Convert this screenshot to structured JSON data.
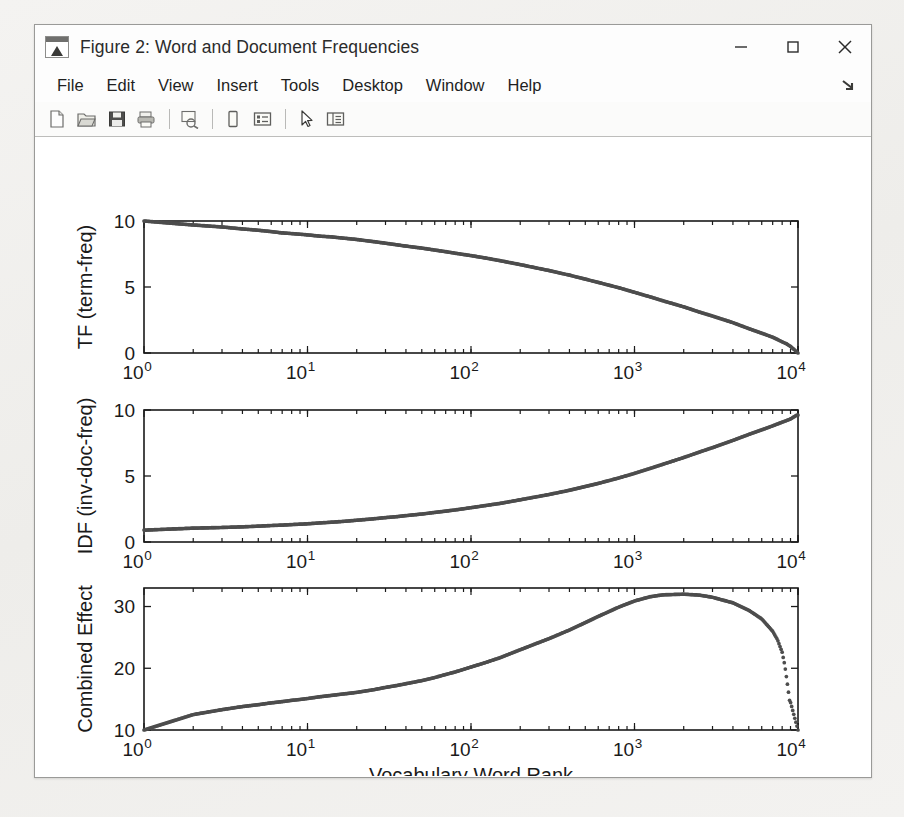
{
  "window": {
    "title": "Figure 2: Word and Document Frequencies",
    "icon": "matlab-figure-icon",
    "controls": {
      "minimize": "minimize-button",
      "maximize": "maximize-button",
      "close": "close-button"
    }
  },
  "menubar": {
    "items": [
      "File",
      "Edit",
      "View",
      "Insert",
      "Tools",
      "Desktop",
      "Window",
      "Help"
    ],
    "dock_icon": "dock-arrow-icon"
  },
  "toolbar": {
    "buttons": [
      {
        "name": "new-figure-icon"
      },
      {
        "name": "open-file-icon"
      },
      {
        "name": "save-figure-icon"
      },
      {
        "name": "print-figure-icon"
      },
      {
        "sep": true
      },
      {
        "name": "print-preview-icon"
      },
      {
        "sep": true
      },
      {
        "name": "insert-colorbar-icon"
      },
      {
        "name": "insert-legend-icon"
      },
      {
        "sep": true
      },
      {
        "name": "edit-plot-arrow-icon"
      },
      {
        "name": "show-plot-tools-icon"
      }
    ]
  },
  "figure": {
    "background": "#ffffff",
    "marker_color": "#4d4d4d",
    "axis_color": "#1a1a1a",
    "shared_xlabel": "Vocabulary Word Rank",
    "x_tick_labels": [
      "10^0",
      "10^1",
      "10^2",
      "10^3",
      "10^4"
    ]
  },
  "chart_data": [
    {
      "type": "scatter",
      "id": "tf-subplot",
      "title": "",
      "xlabel": "",
      "ylabel": "TF (term-freq)",
      "xscale": "log",
      "xlim": [
        1,
        10000
      ],
      "ylim": [
        0,
        10
      ],
      "yticks": [
        0,
        5,
        10
      ],
      "ytick_labels": [
        "0",
        "5",
        "10"
      ],
      "xticks": [
        1,
        10,
        100,
        1000,
        10000
      ],
      "xtick_labels": [
        "10^0",
        "10^1",
        "10^2",
        "10^3",
        "10^4"
      ],
      "grid": false,
      "legend": null,
      "x": [
        1,
        2,
        3,
        4,
        5,
        6,
        7,
        8,
        9,
        10,
        12,
        14,
        16,
        18,
        20,
        25,
        30,
        35,
        40,
        50,
        60,
        70,
        80,
        100,
        125,
        150,
        200,
        250,
        300,
        400,
        500,
        600,
        800,
        1000,
        1250,
        1500,
        2000,
        2500,
        3000,
        4000,
        5000,
        6000,
        7000,
        8000,
        8500,
        9000,
        9500,
        9800,
        10000
      ],
      "y": [
        10.0,
        9.7,
        9.55,
        9.4,
        9.3,
        9.2,
        9.1,
        9.05,
        9.0,
        8.95,
        8.85,
        8.8,
        8.72,
        8.66,
        8.6,
        8.45,
        8.32,
        8.2,
        8.1,
        7.95,
        7.8,
        7.68,
        7.56,
        7.38,
        7.18,
        7.0,
        6.7,
        6.45,
        6.25,
        5.9,
        5.6,
        5.35,
        4.95,
        4.6,
        4.25,
        3.95,
        3.5,
        3.1,
        2.8,
        2.3,
        1.85,
        1.5,
        1.2,
        0.85,
        0.7,
        0.5,
        0.25,
        0.1,
        0.0
      ]
    },
    {
      "type": "scatter",
      "id": "idf-subplot",
      "title": "",
      "xlabel": "",
      "ylabel": "IDF (inv-doc-freq)",
      "xscale": "log",
      "xlim": [
        1,
        10000
      ],
      "ylim": [
        0,
        10
      ],
      "yticks": [
        0,
        5,
        10
      ],
      "ytick_labels": [
        "0",
        "5",
        "10"
      ],
      "xticks": [
        1,
        10,
        100,
        1000,
        10000
      ],
      "xtick_labels": [
        "10^0",
        "10^1",
        "10^2",
        "10^3",
        "10^4"
      ],
      "grid": false,
      "legend": null,
      "x": [
        1,
        2,
        3,
        4,
        5,
        6,
        7,
        8,
        9,
        10,
        12,
        14,
        16,
        18,
        20,
        25,
        30,
        35,
        40,
        50,
        60,
        70,
        80,
        100,
        125,
        150,
        200,
        250,
        300,
        400,
        500,
        600,
        800,
        1000,
        1250,
        1500,
        2000,
        2500,
        3000,
        4000,
        5000,
        6000,
        7000,
        8000,
        8500,
        9000,
        9500,
        9800,
        10000
      ],
      "y": [
        0.9,
        1.05,
        1.1,
        1.15,
        1.2,
        1.25,
        1.28,
        1.32,
        1.35,
        1.38,
        1.45,
        1.5,
        1.55,
        1.6,
        1.65,
        1.75,
        1.85,
        1.92,
        2.0,
        2.12,
        2.24,
        2.34,
        2.43,
        2.6,
        2.78,
        2.92,
        3.2,
        3.42,
        3.6,
        3.92,
        4.2,
        4.44,
        4.85,
        5.2,
        5.58,
        5.9,
        6.4,
        6.82,
        7.15,
        7.7,
        8.15,
        8.5,
        8.8,
        9.08,
        9.2,
        9.32,
        9.5,
        9.6,
        9.62
      ]
    },
    {
      "type": "scatter",
      "id": "combined-effect-subplot",
      "title": "",
      "xlabel": "Vocabulary Word Rank",
      "ylabel": "Combined Effect",
      "xscale": "log",
      "xlim": [
        1,
        10000
      ],
      "ylim": [
        10,
        33
      ],
      "yticks": [
        10,
        20,
        30
      ],
      "ytick_labels": [
        "10",
        "20",
        "30"
      ],
      "xticks": [
        1,
        10,
        100,
        1000,
        10000
      ],
      "xtick_labels": [
        "10^0",
        "10^1",
        "10^2",
        "10^3",
        "10^4"
      ],
      "grid": false,
      "legend": null,
      "x": [
        1,
        2,
        3,
        4,
        5,
        6,
        7,
        8,
        9,
        10,
        12,
        14,
        16,
        18,
        20,
        25,
        30,
        35,
        40,
        50,
        60,
        70,
        80,
        100,
        125,
        150,
        200,
        250,
        300,
        400,
        500,
        600,
        700,
        800,
        1000,
        1250,
        1500,
        2000,
        2500,
        3000,
        4000,
        5000,
        6000,
        7000,
        7500,
        8000,
        8300,
        8600,
        8900,
        9000,
        10000
      ],
      "y": [
        10.0,
        12.5,
        13.3,
        13.8,
        14.1,
        14.4,
        14.6,
        14.8,
        14.95,
        15.1,
        15.4,
        15.6,
        15.8,
        15.95,
        16.1,
        16.5,
        16.9,
        17.2,
        17.5,
        18.0,
        18.5,
        19.0,
        19.4,
        20.2,
        21.0,
        21.7,
        23.0,
        24.0,
        24.8,
        26.2,
        27.4,
        28.4,
        29.2,
        29.9,
        30.9,
        31.6,
        31.9,
        32.0,
        31.85,
        31.5,
        30.6,
        29.4,
        28.0,
        26.0,
        24.6,
        22.6,
        20.5,
        17.6,
        14.6,
        14.5,
        10.0
      ]
    }
  ]
}
